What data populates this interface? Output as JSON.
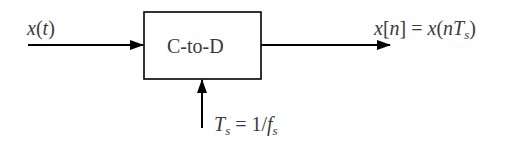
{
  "diagram": {
    "type": "block-diagram",
    "block": {
      "label": "C-to-D"
    },
    "input": {
      "var": "x",
      "paren_open": "(",
      "arg": "t",
      "paren_close": ")"
    },
    "output": {
      "lhs_var": "x",
      "lhs_open": "[",
      "lhs_arg": "n",
      "lhs_close": "]",
      "eq": " = ",
      "rhs_var": "x",
      "rhs_open": "(",
      "rhs_arg": "nT",
      "rhs_sub": "s",
      "rhs_close": ")"
    },
    "control": {
      "var": "T",
      "sub": "s",
      "eq": " = 1/",
      "rhs_var": "f",
      "rhs_sub": "s"
    },
    "colors": {
      "line": "#000000",
      "text": "#3a3a3a"
    }
  }
}
